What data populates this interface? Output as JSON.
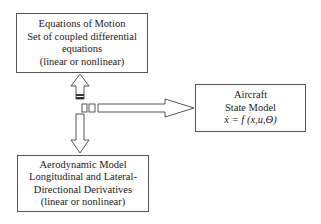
{
  "diagram": {
    "equations_of_motion": {
      "lines": [
        "Equations of Motion",
        "Set of coupled differential",
        "equations",
        "(linear or nonlinear)"
      ]
    },
    "aircraft_state_model": {
      "lines": [
        "Aircraft",
        "State Model",
        "ẋ = f (x,u,Θ)"
      ]
    },
    "aerodynamic_model": {
      "lines": [
        "Aerodynamic Model",
        "Longitudinal and Lateral-",
        "Directional Derivatives",
        "(linear or nonlinear)"
      ]
    },
    "connectors": [
      {
        "from": "junction",
        "to": "equations_of_motion",
        "type": "hollow-arrow-up"
      },
      {
        "from": "junction",
        "to": "aerodynamic_model",
        "type": "hollow-arrow-down"
      },
      {
        "from": "junction",
        "to": "aircraft_state_model",
        "type": "hollow-arrow-right"
      }
    ],
    "colors": {
      "stroke": "#555555",
      "text": "#1a1a1a",
      "background": "#ffffff"
    }
  }
}
